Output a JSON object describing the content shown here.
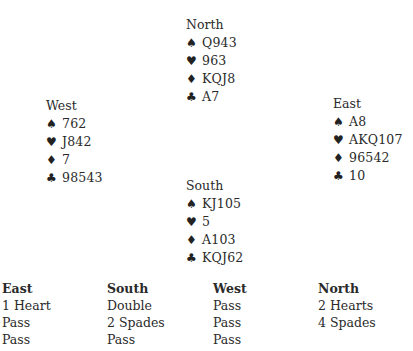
{
  "hands": {
    "north": {
      "name": "North",
      "spades": "Q943",
      "hearts": "963",
      "diamonds": "KQJ8",
      "clubs": "A7"
    },
    "west": {
      "name": "West",
      "spades": "762",
      "hearts": "J842",
      "diamonds": "7",
      "clubs": "98543"
    },
    "east": {
      "name": "East",
      "spades": "A8",
      "hearts": "AKQ107",
      "diamonds": "96542",
      "clubs": "10"
    },
    "south": {
      "name": "South",
      "spades": "KJ105",
      "hearts": "5",
      "diamonds": "A103",
      "clubs": "KQJ62"
    }
  },
  "suit_icons": {
    "spades": "♠",
    "hearts": "♥",
    "diamonds": "♦",
    "clubs": "♣"
  },
  "bidding": {
    "columns": [
      {
        "header": "East",
        "bids": [
          "1 Heart",
          "Pass",
          "Pass"
        ]
      },
      {
        "header": "South",
        "bids": [
          "Double",
          "2 Spades",
          "Pass"
        ]
      },
      {
        "header": "West",
        "bids": [
          "Pass",
          "Pass",
          "Pass"
        ]
      },
      {
        "header": "North",
        "bids": [
          "2 Hearts",
          "4 Spades",
          ""
        ]
      }
    ]
  }
}
